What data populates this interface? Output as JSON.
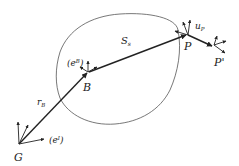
{
  "diagram": {
    "labels": {
      "G": "G",
      "B": "B",
      "P": "P",
      "P_prime": "P'",
      "S": "S",
      "S_sub": "s",
      "r": "r",
      "r_sub": "B",
      "u": "u",
      "u_sub": "P",
      "eB": "(e",
      "eB_sup": "B",
      "eB_close": ")",
      "eI": "(e",
      "eI_sup": "I",
      "eI_close": ")"
    },
    "colors": {
      "stroke": "#222222",
      "outline": "#555555"
    }
  }
}
